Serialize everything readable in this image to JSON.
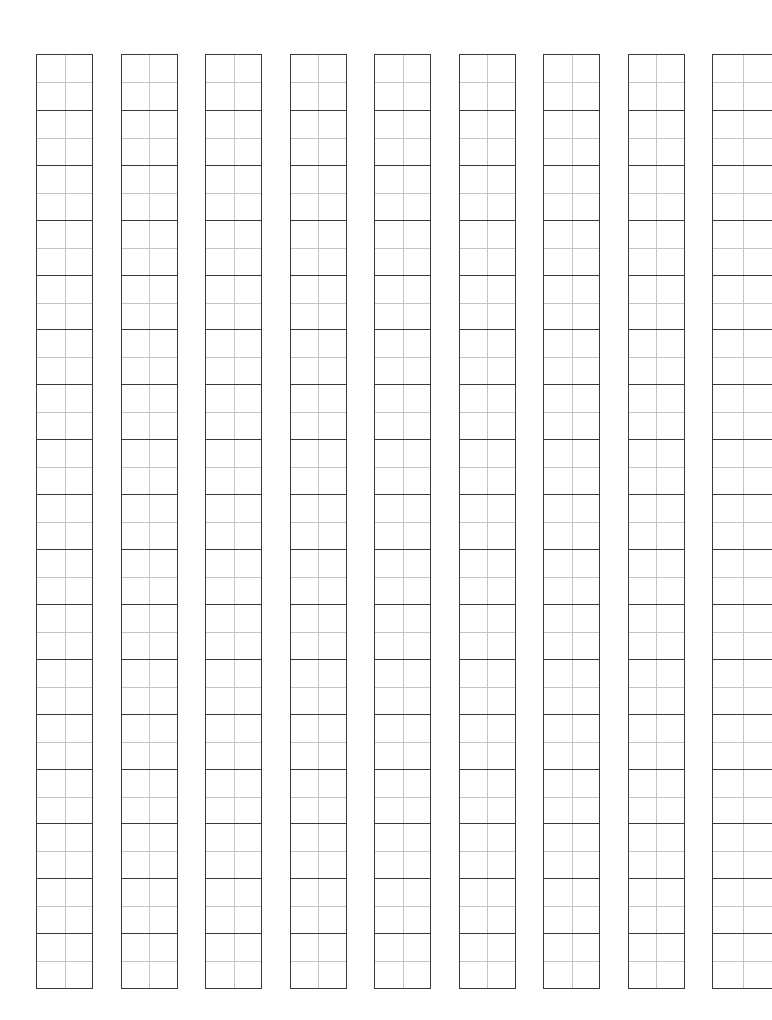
{
  "worksheet": {
    "type": "character practice grid (tianzige)",
    "columns": 9,
    "cells_per_column": 17,
    "last_column_cropped": true,
    "line_color": "#3a3a3a",
    "guide_color": "#c4c4c4"
  }
}
